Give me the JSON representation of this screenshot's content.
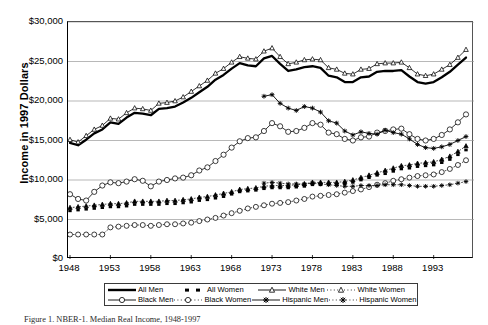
{
  "figure": {
    "ytitle": "Income in 1997 Dollars",
    "caption": "Figure 1.  NBER-1. Median Real Income, 1948-1997"
  },
  "legend": {
    "items": [
      {
        "label": "All Men",
        "key": "solid-thick-line",
        "color": "#000000"
      },
      {
        "label": "All Women",
        "key": "dashed-thick-square",
        "color": "#000000"
      },
      {
        "label": "White Men",
        "key": "line-open-triangle",
        "color": "#000000"
      },
      {
        "label": "White Women",
        "key": "dotted-open-triangle",
        "color": "#000000"
      },
      {
        "label": "Black Men",
        "key": "line-open-circle",
        "color": "#000000"
      },
      {
        "label": "Black Women",
        "key": "dotted-open-circle",
        "color": "#000000"
      },
      {
        "label": "Hispanic Men",
        "key": "line-filled-star",
        "color": "#000000"
      },
      {
        "label": "Hispanic Women",
        "key": "dotted-asterisk",
        "color": "#000000"
      }
    ]
  },
  "chart_data": {
    "type": "line",
    "title": "",
    "xlabel": "",
    "ylabel": "Income in 1997 Dollars",
    "xlim": [
      1948,
      1997
    ],
    "ylim": [
      0,
      30000
    ],
    "yticks": [
      0,
      5000,
      10000,
      15000,
      20000,
      25000,
      30000
    ],
    "ytick_labels": [
      "$0",
      "$5,000",
      "$10,000",
      "$15,000",
      "$20,000",
      "$25,000",
      "$30,000"
    ],
    "xticks": [
      1948,
      1953,
      1958,
      1963,
      1968,
      1973,
      1978,
      1983,
      1988,
      1993
    ],
    "xtick_labels": [
      "1948",
      "1953",
      "1958",
      "1963",
      "1968",
      "1973",
      "1978",
      "1983",
      "1988",
      "1993"
    ],
    "grid": "horizontal",
    "legend_position": "below-axes",
    "x": [
      1948,
      1949,
      1950,
      1951,
      1952,
      1953,
      1954,
      1955,
      1956,
      1957,
      1958,
      1959,
      1960,
      1961,
      1962,
      1963,
      1964,
      1965,
      1966,
      1967,
      1968,
      1969,
      1970,
      1971,
      1972,
      1973,
      1974,
      1975,
      1976,
      1977,
      1978,
      1979,
      1980,
      1981,
      1982,
      1983,
      1984,
      1985,
      1986,
      1987,
      1988,
      1989,
      1990,
      1991,
      1992,
      1993,
      1994,
      1995,
      1996,
      1997
    ],
    "series": [
      {
        "name": "All Men",
        "style": "solid-thick-line",
        "values": [
          14700,
          14400,
          15100,
          15900,
          16400,
          17300,
          17100,
          17900,
          18500,
          18400,
          18200,
          19000,
          19100,
          19300,
          19800,
          20400,
          21100,
          21800,
          22700,
          23300,
          24100,
          24800,
          24500,
          24400,
          25400,
          25700,
          24700,
          23800,
          24000,
          24300,
          24400,
          24200,
          23200,
          23000,
          22400,
          22400,
          23000,
          23100,
          23700,
          23800,
          23800,
          23900,
          23100,
          22400,
          22200,
          22400,
          23000,
          23700,
          24600,
          25500
        ]
      },
      {
        "name": "All Women",
        "style": "dashed-thick-square",
        "values": [
          6100,
          6200,
          6300,
          6400,
          6500,
          6600,
          6600,
          6700,
          6900,
          6900,
          6900,
          6900,
          7000,
          7000,
          7100,
          7200,
          7400,
          7500,
          7700,
          7900,
          8200,
          8500,
          8600,
          8700,
          8900,
          9000,
          9000,
          9000,
          9100,
          9200,
          9400,
          9400,
          9400,
          9400,
          9500,
          9700,
          10000,
          10300,
          10600,
          10800,
          11100,
          11400,
          11500,
          11700,
          11800,
          11900,
          12200,
          12600,
          13200,
          13800
        ]
      },
      {
        "name": "White Men",
        "style": "line-open-triangle",
        "values": [
          15100,
          14800,
          15600,
          16400,
          16900,
          17800,
          17700,
          18500,
          19100,
          19000,
          18800,
          19700,
          19800,
          20000,
          20500,
          21200,
          21900,
          22600,
          23500,
          24100,
          24900,
          25600,
          25400,
          25300,
          26300,
          26700,
          25600,
          24700,
          24900,
          25200,
          25300,
          25200,
          24200,
          24000,
          23500,
          23400,
          24000,
          24100,
          24700,
          24800,
          24800,
          24900,
          24200,
          23400,
          23200,
          23400,
          24000,
          24600,
          25500,
          26500
        ]
      },
      {
        "name": "White Women",
        "style": "dotted-open-triangle",
        "values": [
          6500,
          6600,
          6700,
          6800,
          6900,
          7000,
          7000,
          7100,
          7300,
          7300,
          7300,
          7300,
          7400,
          7400,
          7500,
          7600,
          7800,
          7900,
          8100,
          8300,
          8500,
          8800,
          8900,
          9000,
          9200,
          9300,
          9300,
          9300,
          9400,
          9500,
          9700,
          9700,
          9700,
          9700,
          9800,
          10000,
          10300,
          10600,
          10900,
          11200,
          11500,
          11800,
          11900,
          12100,
          12200,
          12300,
          12600,
          13000,
          13600,
          14300
        ]
      },
      {
        "name": "Black Men",
        "style": "line-open-circle",
        "values": [
          8200,
          7600,
          7400,
          8500,
          9300,
          9700,
          9600,
          9800,
          10100,
          9900,
          9200,
          9800,
          10000,
          10200,
          10300,
          10600,
          11200,
          11600,
          12400,
          13200,
          14100,
          14900,
          15300,
          15400,
          16200,
          17200,
          16800,
          16100,
          16200,
          16600,
          17200,
          17000,
          16000,
          15800,
          15200,
          15000,
          15400,
          15500,
          16000,
          16200,
          16400,
          16500,
          15800,
          15200,
          15000,
          15200,
          15700,
          16400,
          17300,
          18300
        ]
      },
      {
        "name": "Black Women",
        "style": "dotted-open-circle",
        "values": [
          3100,
          3100,
          3100,
          3100,
          3100,
          4000,
          4100,
          4200,
          4300,
          4300,
          4200,
          4300,
          4400,
          4400,
          4500,
          4600,
          4800,
          5000,
          5200,
          5500,
          5800,
          6100,
          6400,
          6600,
          6800,
          7000,
          7100,
          7200,
          7400,
          7600,
          7900,
          8000,
          8100,
          8200,
          8400,
          8600,
          8800,
          9100,
          9400,
          9600,
          9900,
          10100,
          10300,
          10500,
          10600,
          10700,
          11000,
          11400,
          11900,
          12500
        ]
      },
      {
        "name": "Hispanic Men",
        "style": "line-filled-star",
        "values": [
          null,
          null,
          null,
          null,
          null,
          null,
          null,
          null,
          null,
          null,
          null,
          null,
          null,
          null,
          null,
          null,
          null,
          null,
          null,
          null,
          null,
          null,
          null,
          null,
          20600,
          20800,
          19700,
          19100,
          18800,
          19300,
          19100,
          18600,
          17500,
          17200,
          16200,
          15700,
          16100,
          15900,
          15800,
          16300,
          16000,
          15800,
          15200,
          14500,
          14100,
          14000,
          14200,
          14500,
          15000,
          15500
        ]
      },
      {
        "name": "Hispanic Women",
        "style": "dotted-asterisk",
        "values": [
          null,
          null,
          null,
          null,
          null,
          null,
          null,
          null,
          null,
          null,
          null,
          null,
          null,
          null,
          null,
          null,
          null,
          null,
          null,
          null,
          null,
          null,
          null,
          null,
          9600,
          9700,
          9600,
          9500,
          9500,
          9500,
          9600,
          9500,
          9400,
          9300,
          9200,
          9200,
          9300,
          9300,
          9300,
          9400,
          9400,
          9400,
          9300,
          9200,
          9200,
          9200,
          9300,
          9400,
          9600,
          9800
        ]
      }
    ]
  }
}
